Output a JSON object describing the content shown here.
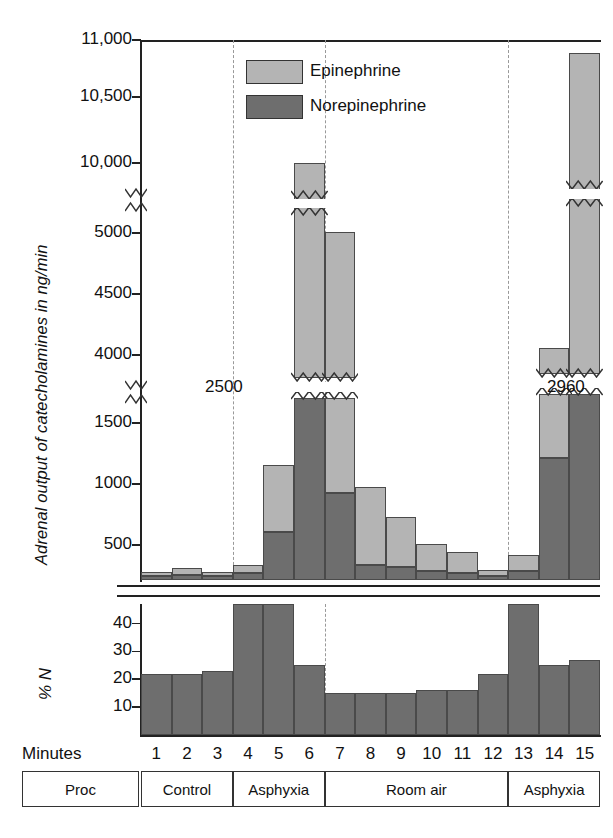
{
  "figure": {
    "y_axis_title": "Adrenal output of catecholamines in ng/min",
    "secondary_axis_title": "% N",
    "x_axis_title": "Minutes"
  },
  "legend": {
    "position": "top-center",
    "items": [
      {
        "label": "Epinephrine",
        "color": "#b4b4b4"
      },
      {
        "label": "Norepinephrine",
        "color": "#6e6e6e"
      }
    ]
  },
  "axis": {
    "tick_labels": [
      "11,000",
      "10,500",
      "10,000",
      "5000",
      "4500",
      "4000",
      "1500",
      "1000",
      "500"
    ],
    "break_annotations": [
      "2500",
      "2960"
    ],
    "pn_tick_labels": [
      "40",
      "30",
      "20",
      "10"
    ]
  },
  "minutes": [
    "1",
    "2",
    "3",
    "4",
    "5",
    "6",
    "7",
    "8",
    "9",
    "10",
    "11",
    "12",
    "13",
    "14",
    "15"
  ],
  "procedure_row": {
    "header": "Proc",
    "segments": [
      {
        "label": "Control",
        "start_minute": 1,
        "end_minute": 3
      },
      {
        "label": "Asphyxia",
        "start_minute": 4,
        "end_minute": 6
      },
      {
        "label": "Room air",
        "start_minute": 7,
        "end_minute": 12
      },
      {
        "label": "Asphyxia",
        "start_minute": 13,
        "end_minute": 15
      }
    ]
  },
  "chart_data": {
    "type": "bar",
    "title": "",
    "subtype": "stacked-bar with broken y-axis",
    "xlabel": "Minutes",
    "ylabel": "Adrenal output of catecholamines in ng/min",
    "categories": [
      "1",
      "2",
      "3",
      "4",
      "5",
      "6",
      "7",
      "8",
      "9",
      "10",
      "11",
      "12",
      "13",
      "14",
      "15"
    ],
    "grid": false,
    "legend_position": "top-center",
    "axis_breaks": [
      {
        "between": [
          1500,
          4000
        ],
        "label_left": "2500"
      },
      {
        "between": [
          5000,
          10000
        ],
        "label_right": "2960"
      }
    ],
    "ylim": [
      0,
      11000
    ],
    "ytick_values": [
      500,
      1000,
      1500,
      4000,
      4500,
      5000,
      10000,
      10500,
      11000
    ],
    "series": [
      {
        "name": "Norepinephrine",
        "color": "#6e6e6e",
        "values": [
          60,
          70,
          55,
          95,
          610,
          2500,
          930,
          215,
          185,
          130,
          105,
          60,
          130,
          1215,
          2960
        ]
      },
      {
        "name": "Epinephrine",
        "color": "#b4b4b4",
        "values": [
          55,
          95,
          65,
          125,
          545,
          7480,
          4170,
          760,
          545,
          380,
          300,
          90,
          225,
          2845,
          7930
        ]
      }
    ],
    "stack_totals": [
      115,
      165,
      120,
      220,
      1155,
      9980,
      5100,
      975,
      730,
      510,
      405,
      150,
      355,
      4060,
      10890
    ],
    "truncated_bars": [
      {
        "minute": 6,
        "total": 9980,
        "break_at": 2500
      },
      {
        "minute": 7,
        "total": 5100,
        "break_at": 2500
      },
      {
        "minute": 14,
        "total": 4060,
        "break_at": 2960
      },
      {
        "minute": 15,
        "total": 10890,
        "break_at": 2960
      }
    ],
    "secondary_panel": {
      "type": "bar",
      "ylabel": "% N",
      "ylim": [
        0,
        47
      ],
      "ytick_values": [
        10,
        20,
        30,
        40
      ],
      "color": "#6e6e6e",
      "values": [
        22,
        22,
        23,
        47,
        47,
        25,
        15,
        15,
        15,
        16,
        16,
        22,
        47,
        25,
        27
      ],
      "clipped_bars": [
        4,
        5,
        13
      ]
    }
  }
}
